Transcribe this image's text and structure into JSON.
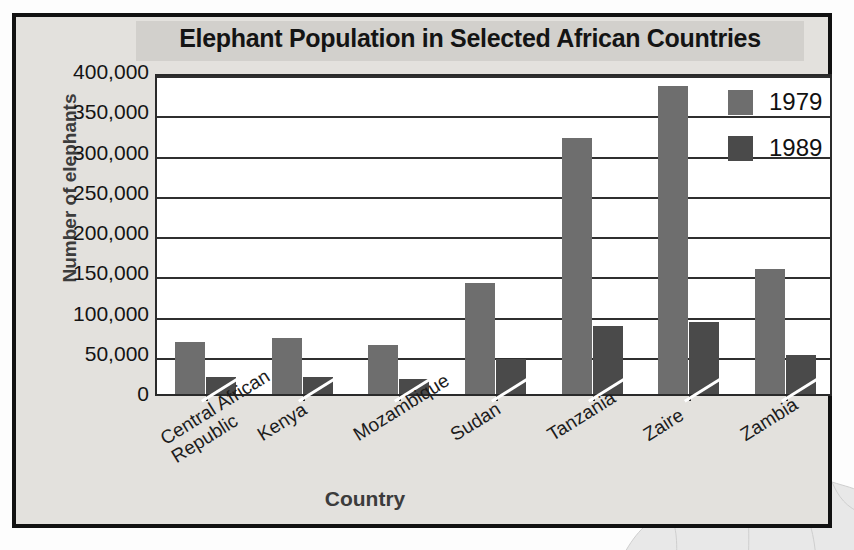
{
  "chart_data": {
    "type": "bar",
    "title": "Elephant Population in Selected African Countries",
    "xlabel": "Country",
    "ylabel": "Number of elephants",
    "categories": [
      "Central African Republic",
      "Kenya",
      "Mozambique",
      "Sudan",
      "Tanzania",
      "Zaire",
      "Zambia"
    ],
    "category_lines": [
      [
        "Central African",
        "Republic"
      ],
      [
        "Kenya"
      ],
      [
        "Mozambique"
      ],
      [
        "Sudan"
      ],
      [
        "Tanzania"
      ],
      [
        "Zaire"
      ],
      [
        "Zambia"
      ]
    ],
    "series": [
      {
        "name": "1979",
        "color": "#6e6e6e",
        "values": [
          65000,
          70000,
          61000,
          138000,
          318000,
          383000,
          155000
        ]
      },
      {
        "name": "1989",
        "color": "#4a4a4a",
        "values": [
          21000,
          21000,
          19000,
          44000,
          84000,
          89000,
          48000
        ]
      }
    ],
    "ylim": [
      0,
      400000
    ],
    "ytick_values": [
      0,
      50000,
      100000,
      150000,
      200000,
      250000,
      300000,
      350000,
      400000
    ],
    "ytick_labels": [
      "0",
      "50,000",
      "100,000",
      "150,000",
      "200,000",
      "250,000",
      "300,000",
      "350,000",
      "400,000"
    ],
    "grid": true,
    "legend_position": "top-right",
    "legend_entries": [
      "1979",
      "1989"
    ]
  },
  "decoration": {
    "map_name": "north-africa-map-watermark"
  }
}
